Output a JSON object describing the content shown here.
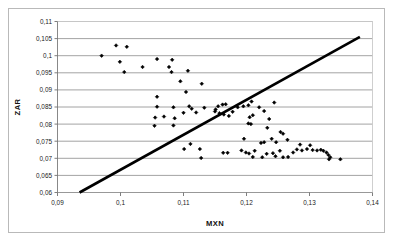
{
  "chart_data": {
    "type": "scatter",
    "title": "",
    "xlabel": "MXN",
    "ylabel": "ZAR",
    "xlim": [
      0.09,
      0.14
    ],
    "ylim": [
      0.06,
      0.11
    ],
    "xticks": [
      0.09,
      0.1,
      0.11,
      0.12,
      0.13,
      0.14
    ],
    "xtick_labels": [
      "0,09",
      "0,1",
      "0,11",
      "0,12",
      "0,13",
      "0,14"
    ],
    "yticks": [
      0.06,
      0.065,
      0.07,
      0.075,
      0.08,
      0.085,
      0.09,
      0.095,
      0.1,
      0.105,
      0.11
    ],
    "ytick_labels": [
      "0,06",
      "0,065",
      "0,07",
      "0,075",
      "0,08",
      "0,085",
      "0,09",
      "0,095",
      "0,1",
      "0,105",
      "0,11"
    ],
    "grid": "horizontal",
    "legend": "none",
    "decimal_separator": ",",
    "marker": "diamond",
    "marker_color": "#000000",
    "trendline": {
      "name": "reference-line",
      "color": "#000000",
      "width": 2.6,
      "x0": 0.0935,
      "y0": 0.06,
      "x1": 0.138,
      "y1": 0.1055
    },
    "points": [
      [
        0.097,
        0.1
      ],
      [
        0.0993,
        0.103
      ],
      [
        0.101,
        0.1026
      ],
      [
        0.1006,
        0.0952
      ],
      [
        0.0999,
        0.0982
      ],
      [
        0.1035,
        0.0967
      ],
      [
        0.1058,
        0.099
      ],
      [
        0.1082,
        0.0988
      ],
      [
        0.1077,
        0.0967
      ],
      [
        0.1081,
        0.0952
      ],
      [
        0.1107,
        0.0956
      ],
      [
        0.1095,
        0.0925
      ],
      [
        0.1129,
        0.0918
      ],
      [
        0.1104,
        0.0894
      ],
      [
        0.1058,
        0.088
      ],
      [
        0.1058,
        0.0851
      ],
      [
        0.1084,
        0.0849
      ],
      [
        0.1109,
        0.0852
      ],
      [
        0.1113,
        0.0845
      ],
      [
        0.1133,
        0.0848
      ],
      [
        0.1151,
        0.0843
      ],
      [
        0.1155,
        0.0852
      ],
      [
        0.1162,
        0.0857
      ],
      [
        0.1167,
        0.0858
      ],
      [
        0.115,
        0.0837
      ],
      [
        0.1157,
        0.0832
      ],
      [
        0.1164,
        0.0828
      ],
      [
        0.1172,
        0.0824
      ],
      [
        0.1178,
        0.0836
      ],
      [
        0.1186,
        0.0849
      ],
      [
        0.1195,
        0.0852
      ],
      [
        0.1203,
        0.0855
      ],
      [
        0.1208,
        0.0866
      ],
      [
        0.1244,
        0.0863
      ],
      [
        0.122,
        0.0849
      ],
      [
        0.1228,
        0.0838
      ],
      [
        0.121,
        0.0826
      ],
      [
        0.1205,
        0.082
      ],
      [
        0.1203,
        0.0802
      ],
      [
        0.1207,
        0.08
      ],
      [
        0.1236,
        0.0815
      ],
      [
        0.1233,
        0.0789
      ],
      [
        0.1254,
        0.0777
      ],
      [
        0.1258,
        0.0772
      ],
      [
        0.1265,
        0.0754
      ],
      [
        0.1247,
        0.0747
      ],
      [
        0.124,
        0.0757
      ],
      [
        0.1223,
        0.0745
      ],
      [
        0.1228,
        0.0747
      ],
      [
        0.1196,
        0.0757
      ],
      [
        0.1055,
        0.0819
      ],
      [
        0.1069,
        0.0822
      ],
      [
        0.1086,
        0.0817
      ],
      [
        0.11,
        0.0833
      ],
      [
        0.112,
        0.0834
      ],
      [
        0.1054,
        0.0795
      ],
      [
        0.1084,
        0.0796
      ],
      [
        0.1101,
        0.0727
      ],
      [
        0.1111,
        0.0742
      ],
      [
        0.1126,
        0.0727
      ],
      [
        0.1128,
        0.0701
      ],
      [
        0.1163,
        0.0716
      ],
      [
        0.117,
        0.0716
      ],
      [
        0.1192,
        0.0723
      ],
      [
        0.1199,
        0.0717
      ],
      [
        0.1204,
        0.0714
      ],
      [
        0.1213,
        0.0722
      ],
      [
        0.121,
        0.0704
      ],
      [
        0.1225,
        0.0703
      ],
      [
        0.1232,
        0.0713
      ],
      [
        0.1242,
        0.0715
      ],
      [
        0.1246,
        0.0706
      ],
      [
        0.1253,
        0.0722
      ],
      [
        0.1258,
        0.0703
      ],
      [
        0.1266,
        0.0704
      ],
      [
        0.1274,
        0.0717
      ],
      [
        0.1285,
        0.074
      ],
      [
        0.128,
        0.0726
      ],
      [
        0.1288,
        0.0723
      ],
      [
        0.1296,
        0.0727
      ],
      [
        0.1301,
        0.0738
      ],
      [
        0.1305,
        0.0724
      ],
      [
        0.1312,
        0.0723
      ],
      [
        0.1318,
        0.0725
      ],
      [
        0.1322,
        0.0722
      ],
      [
        0.1327,
        0.0717
      ],
      [
        0.133,
        0.071
      ],
      [
        0.1333,
        0.0703
      ],
      [
        0.1331,
        0.0697
      ],
      [
        0.1349,
        0.0697
      ]
    ]
  }
}
